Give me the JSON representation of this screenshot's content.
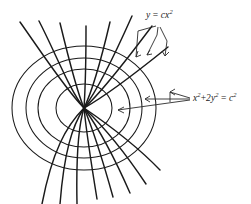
{
  "figure": {
    "background_color": "#ffffff",
    "curve_color": "#1a1a1a",
    "leader_color": "#2a2a2a",
    "origin": {
      "x": 84,
      "y": 108
    },
    "labels": {
      "parabola_family": {
        "text": "y = cx²",
        "base": "y",
        "operator": "=",
        "coefficient": "c",
        "variable": "x",
        "exponent": "2",
        "position": {
          "x": 146,
          "y": 9
        }
      },
      "ellipse_family": {
        "text": "x² + 2y² = c²",
        "term1_variable": "x",
        "term1_exponent": "2",
        "operator_plus": "+",
        "term2_coefficient": "2",
        "term2_variable": "y",
        "term2_exponent": "2",
        "operator_equals": "=",
        "rhs_variable": "c",
        "rhs_exponent": "2",
        "position": {
          "x": 193,
          "y": 92
        }
      }
    }
  },
  "chart_data": {
    "type": "line",
    "xlabel": "",
    "ylabel": "",
    "grid": false,
    "legend_position": "annotations",
    "center_pixel": {
      "x": 84,
      "y": 108
    },
    "series": [
      {
        "name": "x² + 2y² = c²",
        "family": "ellipses",
        "count": 4,
        "description": "Concentric ellipses centered at the origin, horizontally elongated",
        "members": [
          {
            "c": 1,
            "semi_axis_x": 28,
            "semi_axis_y": 24
          },
          {
            "c": 2,
            "semi_axis_x": 46,
            "semi_axis_y": 39
          },
          {
            "c": 3,
            "semi_axis_x": 58,
            "semi_axis_y": 50
          },
          {
            "c": 4,
            "semi_axis_x": 72,
            "semi_axis_y": 62
          }
        ]
      },
      {
        "name": "y = cx²",
        "family": "parabolas",
        "count": 8,
        "description": "Parabolas through the origin, opening left and right, intersecting the ellipses at right angles",
        "members": [
          {
            "c": -2.2
          },
          {
            "c": -1.4
          },
          {
            "c": -0.85
          },
          {
            "c": -0.45
          },
          {
            "c": 0.45
          },
          {
            "c": 0.85
          },
          {
            "c": 1.4
          },
          {
            "c": 2.2
          }
        ]
      }
    ],
    "annotations": [
      {
        "text": "y = cx²",
        "target": "parabola-family",
        "leaders": 3
      },
      {
        "text": "x² + 2y² = c²",
        "target": "ellipse-family",
        "leaders": 3
      }
    ]
  }
}
